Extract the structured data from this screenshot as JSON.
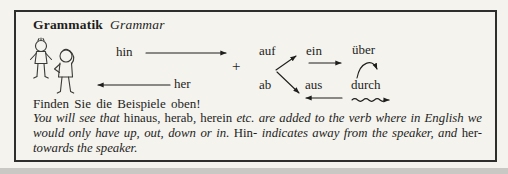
{
  "title": {
    "german": "Grammatik",
    "english": "Grammar"
  },
  "diagram": {
    "hin": "hin",
    "her": "her",
    "plus": "+",
    "auf": "auf",
    "ein": "ein",
    "ueber": "über",
    "ab": "ab",
    "aus": "aus",
    "durch": "durch"
  },
  "instruction": "Finden Sie die Beispiele oben!",
  "explanation": {
    "lines": [
      [
        {
          "text": "You will see that ",
          "italic": true
        },
        {
          "text": "hinaus, herab, herein ",
          "italic": false
        },
        {
          "text": "etc.",
          "italic": true
        },
        {
          "text": " ",
          "italic": false
        },
        {
          "text": "are added to the verb where in English we",
          "italic": true
        }
      ],
      [
        {
          "text": "would only have up, out, down or in.",
          "italic": true
        },
        {
          "text": " Hin- ",
          "italic": false
        },
        {
          "text": "indicates away from the speaker, and ",
          "italic": true
        },
        {
          "text": "her-",
          "italic": false
        }
      ],
      [
        {
          "text": "towards the speaker.",
          "italic": true
        }
      ]
    ]
  },
  "colors": {
    "paper": "#f4f3ee",
    "ink": "#1e1e1c",
    "border": "#2e2e2c",
    "page_edge": "#c9c8c4"
  }
}
